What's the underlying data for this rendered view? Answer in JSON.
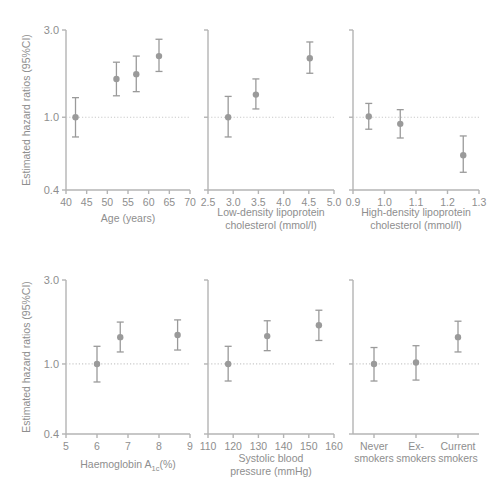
{
  "figure": {
    "y_axis_label": "Estimated hazard ratios (95%CI)",
    "y_ticks": [
      "0.4",
      "1.0",
      "3.0"
    ],
    "y_tick_values": [
      0.4,
      1.0,
      3.0
    ],
    "y_scale": "log",
    "reference_line": 1.0,
    "marker_color": "#9a9a9a",
    "axis_color": "#b4b4b4",
    "text_color": "#8e8e8e"
  },
  "chart_data": [
    {
      "type": "scatter",
      "panel_id": "age",
      "title": "",
      "xlabel": "Age (years)",
      "xlabel_lines": [
        "Age (years)"
      ],
      "ylabel": "Estimated hazard ratios (95%CI)",
      "ylim": [
        0.4,
        3.0
      ],
      "yscale": "log",
      "yticks": [
        0.4,
        1.0,
        3.0
      ],
      "ytick_labels": [
        "0.4",
        "1.0",
        "3.0"
      ],
      "xlim": [
        40,
        70
      ],
      "xticks": [
        40,
        45,
        50,
        55,
        60,
        65,
        70
      ],
      "xtick_labels": [
        "40",
        "45",
        "50",
        "55",
        "60",
        "65",
        "70"
      ],
      "grid": false,
      "reference_line_y": 1.0,
      "x": [
        42.3,
        52.2,
        57.0,
        62.5
      ],
      "values": [
        1.0,
        1.62,
        1.72,
        2.16
      ],
      "ci_low": [
        0.78,
        1.31,
        1.38,
        1.78
      ],
      "ci_high": [
        1.28,
        2.0,
        2.16,
        2.67
      ]
    },
    {
      "type": "scatter",
      "panel_id": "ldl",
      "title": "",
      "xlabel": "Low-density lipoprotein cholesterol (mmol/l)",
      "xlabel_lines": [
        "Low-density lipoprotein",
        "cholesterol (mmol/l)"
      ],
      "ylabel": "",
      "ylim": [
        0.4,
        3.0
      ],
      "yscale": "log",
      "yticks": [
        0.4,
        1.0,
        3.0
      ],
      "ytick_labels": [
        "0.4",
        "1.0",
        "3.0"
      ],
      "xlim": [
        2.5,
        5.0
      ],
      "xticks": [
        2.5,
        3.0,
        3.5,
        4.0,
        4.5,
        5.0
      ],
      "xtick_labels": [
        "2.5",
        "3.0",
        "3.5",
        "4.0",
        "4.5",
        "5.0"
      ],
      "grid": false,
      "reference_line_y": 1.0,
      "x": [
        2.9,
        3.45,
        4.52
      ],
      "values": [
        1.0,
        1.33,
        2.1
      ],
      "ci_low": [
        0.78,
        1.11,
        1.74
      ],
      "ci_high": [
        1.3,
        1.62,
        2.58
      ]
    },
    {
      "type": "scatter",
      "panel_id": "hdl",
      "title": "",
      "xlabel": "High-density lipoprotein cholesterol (mmol/l)",
      "xlabel_lines": [
        "High-density lipoprotein",
        "cholesterol (mmol/l)"
      ],
      "ylabel": "",
      "ylim": [
        0.4,
        3.0
      ],
      "yscale": "log",
      "yticks": [
        0.4,
        1.0,
        3.0
      ],
      "ytick_labels": [
        "0.4",
        "1.0",
        "3.0"
      ],
      "xlim": [
        0.9,
        1.3
      ],
      "xticks": [
        0.9,
        1.0,
        1.1,
        1.2,
        1.3
      ],
      "xtick_labels": [
        "0.9",
        "1.0",
        "1.1",
        "1.2",
        "1.3"
      ],
      "grid": false,
      "reference_line_y": 1.0,
      "x": [
        0.95,
        1.05,
        1.25
      ],
      "values": [
        1.01,
        0.92,
        0.62
      ],
      "ci_low": [
        0.86,
        0.77,
        0.5
      ],
      "ci_high": [
        1.19,
        1.1,
        0.79
      ]
    },
    {
      "type": "scatter",
      "panel_id": "hba1c",
      "title": "",
      "xlabel": "Haemoglobin A1c(%)",
      "xlabel_lines": [
        "Haemoglobin A1c(%)"
      ],
      "xlabel_parts": {
        "pre": "Haemoglobin A",
        "sub": "1c",
        "post": "(%)"
      },
      "ylabel": "Estimated hazard ratios (95%CI)",
      "ylim": [
        0.4,
        3.0
      ],
      "yscale": "log",
      "yticks": [
        0.4,
        1.0,
        3.0
      ],
      "ytick_labels": [
        "0.4",
        "1.0",
        "3.0"
      ],
      "xlim": [
        5,
        9
      ],
      "xticks": [
        5,
        6,
        7,
        8,
        9
      ],
      "xtick_labels": [
        "5",
        "6",
        "7",
        "8",
        "9"
      ],
      "grid": false,
      "reference_line_y": 1.0,
      "x": [
        6.0,
        6.75,
        8.6
      ],
      "values": [
        1.0,
        1.42,
        1.46
      ],
      "ci_low": [
        0.79,
        1.17,
        1.2
      ],
      "ci_high": [
        1.26,
        1.73,
        1.78
      ]
    },
    {
      "type": "scatter",
      "panel_id": "sbp",
      "title": "",
      "xlabel": "Systolic blood pressure (mmHg)",
      "xlabel_lines": [
        "Systolic blood",
        "pressure (mmHg)"
      ],
      "ylabel": "",
      "ylim": [
        0.4,
        3.0
      ],
      "yscale": "log",
      "yticks": [
        0.4,
        1.0,
        3.0
      ],
      "ytick_labels": [
        "0.4",
        "1.0",
        "3.0"
      ],
      "xlim": [
        110,
        160
      ],
      "xticks": [
        110,
        120,
        130,
        140,
        150,
        160
      ],
      "xtick_labels": [
        "110",
        "120",
        "130",
        "140",
        "150",
        "160"
      ],
      "grid": false,
      "reference_line_y": 1.0,
      "x": [
        118,
        133.5,
        154
      ],
      "values": [
        1.0,
        1.44,
        1.66
      ],
      "ci_low": [
        0.8,
        1.19,
        1.36
      ],
      "ci_high": [
        1.26,
        1.76,
        2.02
      ]
    },
    {
      "type": "scatter",
      "panel_id": "smoking",
      "title": "",
      "xlabel": "",
      "xlabel_lines": [],
      "ylabel": "",
      "ylim": [
        0.4,
        3.0
      ],
      "yscale": "log",
      "yticks": [
        0.4,
        1.0,
        3.0
      ],
      "ytick_labels": [
        "0.4",
        "1.0",
        "3.0"
      ],
      "categories": [
        "Never smokers",
        "Ex- smokers",
        "Current smokers"
      ],
      "category_lines": [
        [
          "Never",
          "smokers"
        ],
        [
          "Ex-",
          "smokers"
        ],
        [
          "Current",
          "smokers"
        ]
      ],
      "grid": false,
      "reference_line_y": 1.0,
      "values": [
        1.0,
        1.02,
        1.42
      ],
      "ci_low": [
        0.8,
        0.81,
        1.17
      ],
      "ci_high": [
        1.24,
        1.27,
        1.75
      ]
    }
  ]
}
